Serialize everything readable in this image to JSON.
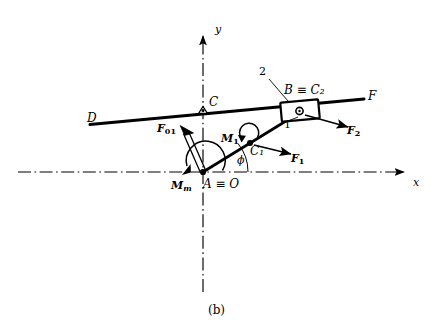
{
  "figure": {
    "caption": "(b)",
    "background_color": "#ffffff",
    "line_color": "#000000"
  },
  "axes": {
    "x_label": "x",
    "y_label": "y",
    "x_axis_style": "dash-dot centerline with arrowhead at right",
    "y_axis_style": "dash-dot centerline with arrowhead at top"
  },
  "points": [
    {
      "id": "origin",
      "label": "A ≡ O",
      "x": 203,
      "y": 172,
      "kind": "pin-joint-filled"
    },
    {
      "id": "pivot-c",
      "label": "C",
      "x": 203,
      "y": 110,
      "kind": "pivot-support"
    },
    {
      "id": "slider",
      "label": "B ≡ C₂",
      "x": 300,
      "y": 110,
      "kind": "slider-block"
    },
    {
      "id": "cm1",
      "label": "C₁",
      "x": 250,
      "y": 143,
      "kind": "mass-center-filled"
    },
    {
      "id": "bar-left",
      "label": "D",
      "x": 90,
      "y": 123,
      "kind": "bar-end"
    },
    {
      "id": "bar-right",
      "label": "F",
      "x": 367,
      "y": 97,
      "kind": "bar-end"
    }
  ],
  "links": [
    {
      "id": "link-1",
      "label": "1",
      "from": "A ≡ O",
      "to": "B ≡ C₂"
    },
    {
      "id": "link-2",
      "label": "2",
      "from": "B ≡ C₂",
      "to": "slider on bar DF"
    }
  ],
  "forces": [
    {
      "id": "F01",
      "label": "F",
      "subscript": "01",
      "style": "double-line open arrow",
      "direction": "up-left from origin"
    },
    {
      "id": "F1",
      "label": "F",
      "subscript": "1",
      "style": "solid arrow",
      "direction": "right and slightly down from C₁"
    },
    {
      "id": "F2",
      "label": "F",
      "subscript": "2",
      "style": "solid arrow",
      "direction": "right and slightly down from slider"
    }
  ],
  "moments": [
    {
      "id": "Mm",
      "label": "M",
      "subscript": "m",
      "style": "large curved arc arrow",
      "at": "A ≡ O"
    },
    {
      "id": "M1",
      "label": "M",
      "subscript": "1",
      "style": "small curved arc arrow",
      "at": "C₁"
    }
  ],
  "angles": [
    {
      "id": "phi",
      "label": "ϕ",
      "between": "x-axis and link 1"
    }
  ]
}
